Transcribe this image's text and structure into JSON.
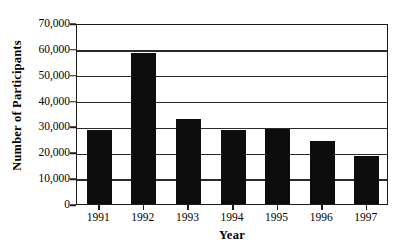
{
  "chart_data": {
    "type": "bar",
    "title": "",
    "xlabel": "Year",
    "ylabel": "Number of Participants",
    "categories": [
      "1991",
      "1992",
      "1993",
      "1994",
      "1995",
      "1996",
      "1997"
    ],
    "values": [
      28500,
      58500,
      33000,
      28500,
      29000,
      24500,
      18500
    ],
    "series": [
      {
        "name": "Number of Participants",
        "values": [
          28500,
          58500,
          33000,
          28500,
          29000,
          24500,
          18500
        ]
      }
    ],
    "ylim": [
      0,
      70000
    ],
    "ytick_values": [
      0,
      10000,
      20000,
      30000,
      40000,
      50000,
      60000,
      70000
    ],
    "ytick_labels": [
      "0",
      "10,000",
      "20,000",
      "30,000",
      "40,000",
      "50,000",
      "60,000",
      "70,000"
    ],
    "grid": true,
    "grid_axis": "y",
    "legend": false,
    "legend_position": "none",
    "bar_color": "#0d0d0d",
    "axis_color": "#1b1b1b",
    "background_color": "#ffffff"
  }
}
